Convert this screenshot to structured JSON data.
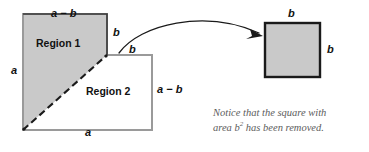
{
  "figure": {
    "colors": {
      "shade_fill": "#c9c9c9",
      "outline": "#9a9a9a",
      "dark_outline": "#1a1a1a",
      "dashed": "#1a1a1a",
      "arrow": "#1a1a1a",
      "text": "#111111",
      "caption_text": "#5c5c5c",
      "background": "#ffffff"
    },
    "main_shape": {
      "name": "notched-square",
      "description": "square of side a with a b-by-b square removed from the top-right corner",
      "regions": [
        {
          "id": "region-1",
          "label": "Region 1",
          "fill": "shaded"
        },
        {
          "id": "region-2",
          "label": "Region 2",
          "fill": "white"
        }
      ],
      "labels": {
        "top": "a − b",
        "left": "a",
        "bottom": "a",
        "notch_vertical": "b",
        "notch_horizontal": "b",
        "region2_right": "a − b"
      }
    },
    "removed_square": {
      "name": "removed-b-square",
      "fill": "shaded",
      "labels": {
        "top": "b",
        "right": "b"
      }
    },
    "arrow": {
      "name": "curved-arrow",
      "direction": "left-to-right"
    },
    "caption": {
      "line1": "Notice that the square with",
      "line2_prefix": "area b",
      "line2_sup": "2",
      "line2_suffix": " has been removed."
    }
  }
}
